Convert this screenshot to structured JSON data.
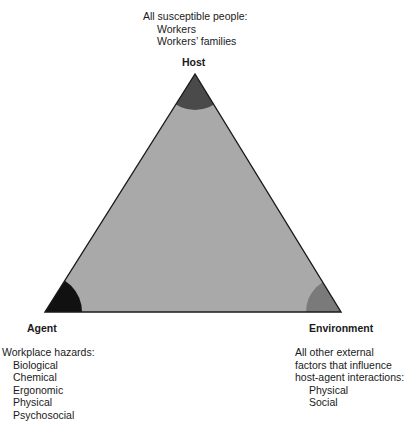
{
  "diagram": {
    "colors": {
      "triangle_fill": "#a9a9a9",
      "triangle_stroke": "#1a1a1a",
      "host_arc": "#4a4a4a",
      "agent_arc": "#111111",
      "environment_arc": "#7a7a7a"
    },
    "host": {
      "label": "Host",
      "description": "All susceptible people:",
      "items": [
        "Workers",
        "Workers’ families"
      ]
    },
    "agent": {
      "label": "Agent",
      "description": "Workplace hazards:",
      "items": [
        "Biological",
        "Chemical",
        "Ergonomic",
        "Physical",
        "Psychosocial"
      ]
    },
    "environment": {
      "label": "Environment",
      "description_lines": [
        "All other external",
        "factors that influence",
        "host-agent interactions:"
      ],
      "items": [
        "Physical",
        "Social"
      ]
    }
  }
}
